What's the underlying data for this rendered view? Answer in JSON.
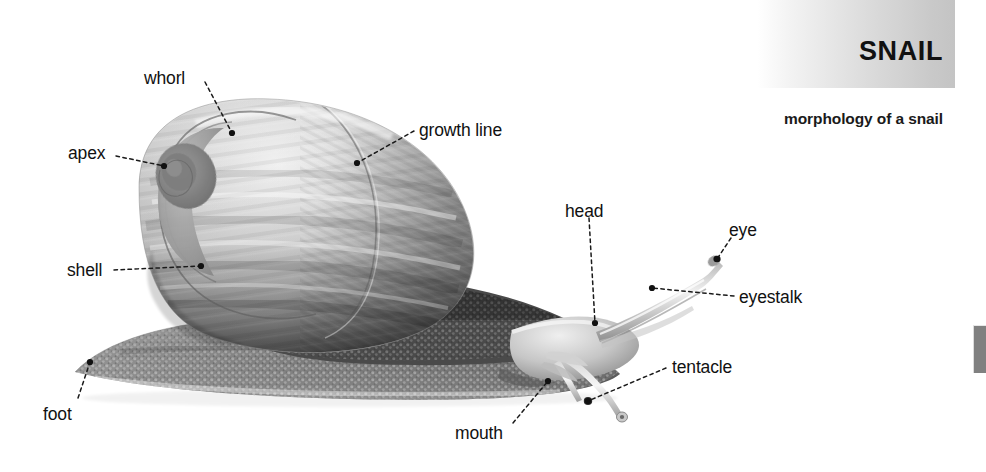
{
  "header": {
    "title": "SNAIL",
    "subtitle": "morphology of a snail",
    "band_gradient_from": "#ffffff",
    "band_gradient_to": "#c4c4c4",
    "side_tab_color": "#808080"
  },
  "figure": {
    "subject": "snail",
    "view": "lateral view",
    "background_color": "#ffffff",
    "illustration_style": "grayscale airbrush rendering"
  },
  "labels": [
    {
      "id": "whorl",
      "text": "whorl",
      "x": 144,
      "y": 68,
      "anchor": "start",
      "leader": {
        "from": [
          205,
          82
        ],
        "to": [
          232,
          133
        ]
      },
      "dot": [
        232,
        133
      ]
    },
    {
      "id": "apex",
      "text": "apex",
      "x": 68,
      "y": 143,
      "anchor": "start",
      "leader": {
        "from": [
          116,
          156
        ],
        "to": [
          164,
          166
        ]
      },
      "dot": [
        164,
        166
      ]
    },
    {
      "id": "growth-line",
      "text": "growth line",
      "x": 419,
      "y": 120,
      "anchor": "start",
      "leader": {
        "from": [
          414,
          131
        ],
        "to": [
          357,
          163
        ]
      },
      "dot": [
        357,
        163
      ]
    },
    {
      "id": "shell",
      "text": "shell",
      "x": 67,
      "y": 260,
      "anchor": "start",
      "leader": {
        "from": [
          114,
          270
        ],
        "to": [
          201,
          266
        ]
      },
      "dot": [
        201,
        266
      ]
    },
    {
      "id": "foot",
      "text": "foot",
      "x": 43,
      "y": 404,
      "anchor": "start",
      "leader": {
        "from": [
          78,
          398
        ],
        "to": [
          90,
          362
        ]
      },
      "dot": [
        90,
        362
      ]
    },
    {
      "id": "head",
      "text": "head",
      "x": 565,
      "y": 201,
      "anchor": "start",
      "leader": {
        "from": [
          589,
          218
        ],
        "to": [
          595,
          323
        ]
      },
      "dot": [
        595,
        323
      ]
    },
    {
      "id": "eye",
      "text": "eye",
      "x": 729,
      "y": 220,
      "anchor": "start",
      "leader": {
        "from": [
          731,
          238
        ],
        "to": [
          717,
          259
        ]
      },
      "dot": [
        717,
        259
      ]
    },
    {
      "id": "eyestalk",
      "text": "eyestalk",
      "x": 739,
      "y": 287,
      "anchor": "start",
      "leader": {
        "from": [
          734,
          296
        ],
        "to": [
          652,
          288
        ]
      },
      "dot": [
        652,
        288
      ]
    },
    {
      "id": "tentacle",
      "text": "tentacle",
      "x": 672,
      "y": 357,
      "anchor": "start",
      "leader": {
        "from": [
          666,
          368
        ],
        "to": [
          588,
          401
        ]
      },
      "dot": [
        588,
        401
      ]
    },
    {
      "id": "mouth",
      "text": "mouth",
      "x": 455,
      "y": 423,
      "anchor": "start",
      "leader": {
        "from": [
          513,
          423
        ],
        "to": [
          548,
          381
        ]
      },
      "dot": [
        548,
        381
      ]
    }
  ]
}
